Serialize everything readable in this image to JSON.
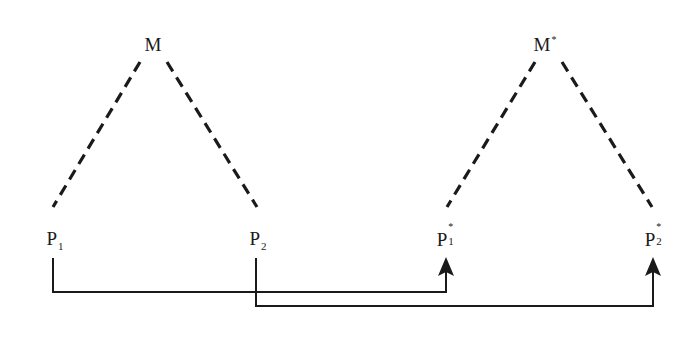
{
  "diagram": {
    "colors": {
      "background": "#ffffff",
      "stroke": "#1a1a1a",
      "text": "#1a1a1a"
    },
    "nodes": {
      "M": {
        "base": "M",
        "sup": "",
        "sub": "",
        "x": 153,
        "y": 44
      },
      "Ms": {
        "base": "M",
        "sup": "*",
        "sub": "",
        "x": 545,
        "y": 44
      },
      "P1": {
        "base": "P",
        "sup": "",
        "sub": "1",
        "x": 55,
        "y": 238
      },
      "P2": {
        "base": "P",
        "sup": "",
        "sub": "2",
        "x": 258,
        "y": 238
      },
      "P1s": {
        "base": "P",
        "sup": "*",
        "sub": "1",
        "x": 446,
        "y": 238
      },
      "P2s": {
        "base": "P",
        "sup": "*",
        "sub": "2",
        "x": 654,
        "y": 238
      }
    },
    "dashed_edges": [
      {
        "from": "M",
        "to": "P1",
        "x1": 140,
        "y1": 62,
        "x2": 53,
        "y2": 207
      },
      {
        "from": "M",
        "to": "P2",
        "x1": 167,
        "y1": 62,
        "x2": 257,
        "y2": 207
      },
      {
        "from": "M*",
        "to": "P1*",
        "x1": 535,
        "y1": 62,
        "x2": 447,
        "y2": 207
      },
      {
        "from": "M*",
        "to": "P2*",
        "x1": 562,
        "y1": 62,
        "x2": 652,
        "y2": 207
      }
    ],
    "arrow_connectors": [
      {
        "from": "P1",
        "to": "P1*",
        "points": "53,258 53,292 446,292 446,272",
        "tip_x": 446,
        "tip_y": 257
      },
      {
        "from": "P2",
        "to": "P2*",
        "points": "256,258 256,306 653,306 653,272",
        "tip_x": 653,
        "tip_y": 257
      }
    ]
  }
}
